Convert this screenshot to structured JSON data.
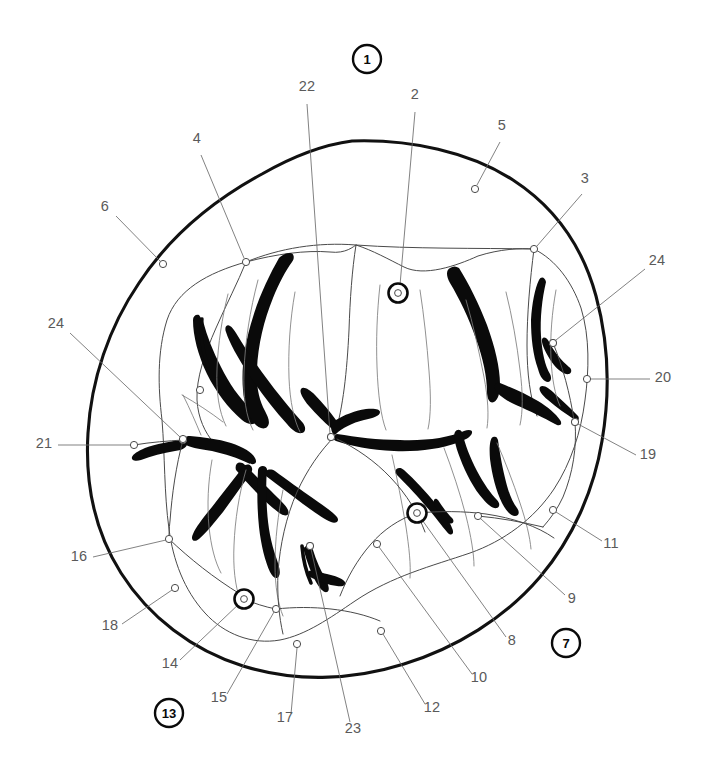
{
  "figure": {
    "kind": "anatomical-line-drawing",
    "background_color": "#ffffff",
    "outline_color": "#111111",
    "groove_color": "#0a0a0a",
    "leader_color": "#6b6b6b",
    "label_color": "#5a5a5a",
    "width": 704,
    "height": 778
  },
  "circled_references": [
    {
      "id": "circled-1",
      "label": "1",
      "cx": 367,
      "cy": 59,
      "r": 14
    },
    {
      "id": "circled-7",
      "label": "7",
      "cx": 566,
      "cy": 643,
      "r": 14
    },
    {
      "id": "circled-13",
      "label": "13",
      "cx": 169,
      "cy": 713,
      "r": 14
    }
  ],
  "callouts": [
    {
      "num": "2",
      "text_x": 415,
      "text_y": 99,
      "anchor": "middle",
      "path": "M 415 112 L 400 285",
      "marker": {
        "type": "target",
        "x": 398,
        "y": 293
      }
    },
    {
      "num": "22",
      "text_x": 307,
      "text_y": 91,
      "anchor": "middle",
      "path": "M 307 104 L 330 434",
      "marker": {
        "type": "dot",
        "x": 331,
        "y": 437
      }
    },
    {
      "num": "5",
      "text_x": 502,
      "text_y": 130,
      "anchor": "middle",
      "path": "M 500 142 L 477 185",
      "marker": {
        "type": "dot",
        "x": 475,
        "y": 189
      }
    },
    {
      "num": "4",
      "text_x": 197,
      "text_y": 143,
      "anchor": "middle",
      "path": "M 201 155 L 244 258",
      "marker": {
        "type": "dot",
        "x": 246,
        "y": 262
      }
    },
    {
      "num": "3",
      "text_x": 585,
      "text_y": 183,
      "anchor": "middle",
      "path": "M 582 194 L 537 246",
      "marker": {
        "type": "dot",
        "x": 534,
        "y": 249
      }
    },
    {
      "num": "6",
      "text_x": 105,
      "text_y": 211,
      "anchor": "middle",
      "path": "M 116 216 L 160 261",
      "marker": {
        "type": "dot",
        "x": 163,
        "y": 264
      }
    },
    {
      "num": "24",
      "text_x": 657,
      "text_y": 265,
      "anchor": "middle",
      "path": "M 645 269 L 556 340",
      "marker": {
        "type": "dot",
        "x": 553,
        "y": 343
      }
    },
    {
      "num": "24",
      "text_x": 56,
      "text_y": 328,
      "anchor": "middle",
      "path": "M 70 333 L 180 437",
      "marker": {
        "type": "dot",
        "x": 183,
        "y": 440
      }
    },
    {
      "num": "20",
      "text_x": 663,
      "text_y": 382,
      "anchor": "middle",
      "path": "M 650 379 L 590 379",
      "marker": {
        "type": "dot",
        "x": 587,
        "y": 379
      }
    },
    {
      "num": "19",
      "text_x": 648,
      "text_y": 459,
      "anchor": "middle",
      "path": "M 636 455 L 578 424",
      "marker": {
        "type": "dot",
        "x": 575,
        "y": 422
      }
    },
    {
      "num": "21",
      "text_x": 44,
      "text_y": 448,
      "anchor": "middle",
      "path": "M 58 445 L 131 445",
      "marker": {
        "type": "dot",
        "x": 134,
        "y": 445
      }
    },
    {
      "num": "11",
      "text_x": 611,
      "text_y": 548,
      "anchor": "middle",
      "path": "M 602 541 L 556 512",
      "marker": {
        "type": "dot",
        "x": 553,
        "y": 510
      }
    },
    {
      "num": "16",
      "text_x": 79,
      "text_y": 561,
      "anchor": "middle",
      "path": "M 93 557 L 166 540",
      "marker": {
        "type": "dot",
        "x": 169,
        "y": 539
      }
    },
    {
      "num": "9",
      "text_x": 572,
      "text_y": 603,
      "anchor": "middle",
      "path": "M 565 595 L 481 519",
      "marker": {
        "type": "dot",
        "x": 478,
        "y": 516
      }
    },
    {
      "num": "18",
      "text_x": 110,
      "text_y": 630,
      "anchor": "middle",
      "path": "M 122 624 L 172 590",
      "marker": {
        "type": "dot",
        "x": 175,
        "y": 588
      }
    },
    {
      "num": "8",
      "text_x": 512,
      "text_y": 645,
      "anchor": "middle",
      "path": "M 506 637 L 420 517",
      "marker": {
        "type": "target",
        "x": 417,
        "y": 513
      }
    },
    {
      "num": "14",
      "text_x": 170,
      "text_y": 668,
      "anchor": "middle",
      "path": "M 180 660 L 241 602",
      "marker": {
        "type": "target",
        "x": 244,
        "y": 599
      }
    },
    {
      "num": "10",
      "text_x": 479,
      "text_y": 682,
      "anchor": "middle",
      "path": "M 472 674 L 379 547",
      "marker": {
        "type": "dot",
        "x": 377,
        "y": 544
      }
    },
    {
      "num": "12",
      "text_x": 432,
      "text_y": 712,
      "anchor": "middle",
      "path": "M 425 704 L 383 634",
      "marker": {
        "type": "dot",
        "x": 381,
        "y": 631
      }
    },
    {
      "num": "15",
      "text_x": 219,
      "text_y": 702,
      "anchor": "middle",
      "path": "M 227 694 L 274 612",
      "marker": {
        "type": "dot",
        "x": 276,
        "y": 609
      }
    },
    {
      "num": "17",
      "text_x": 285,
      "text_y": 722,
      "anchor": "middle",
      "path": "M 291 714 L 297 648",
      "marker": {
        "type": "dot",
        "x": 297,
        "y": 644
      }
    },
    {
      "num": "23",
      "text_x": 353,
      "text_y": 733,
      "anchor": "middle",
      "path": "M 350 722 L 311 549",
      "marker": {
        "type": "dot",
        "x": 310,
        "y": 546
      }
    }
  ],
  "internal_markers": [
    {
      "id": "junction-a",
      "x": 183,
      "y": 439
    },
    {
      "id": "junction-b",
      "x": 200,
      "y": 390
    },
    {
      "id": "junction-c",
      "x": 331,
      "y": 437
    },
    {
      "id": "junction-d",
      "x": 575,
      "y": 422
    },
    {
      "id": "junction-e",
      "x": 553,
      "y": 343
    },
    {
      "id": "junction-f",
      "x": 310,
      "y": 546
    }
  ],
  "chart_data": {
    "type": "table",
    "columns": [
      "callout",
      "kind"
    ],
    "rows": [
      [
        "1",
        "circled-reference"
      ],
      [
        "2",
        "target-marker"
      ],
      [
        "3",
        "dot-marker"
      ],
      [
        "4",
        "dot-marker"
      ],
      [
        "5",
        "dot-marker"
      ],
      [
        "6",
        "dot-marker"
      ],
      [
        "7",
        "circled-reference"
      ],
      [
        "8",
        "target-marker"
      ],
      [
        "9",
        "dot-marker"
      ],
      [
        "10",
        "dot-marker"
      ],
      [
        "11",
        "dot-marker"
      ],
      [
        "12",
        "dot-marker"
      ],
      [
        "13",
        "circled-reference"
      ],
      [
        "14",
        "target-marker"
      ],
      [
        "15",
        "dot-marker"
      ],
      [
        "16",
        "dot-marker"
      ],
      [
        "17",
        "dot-marker"
      ],
      [
        "18",
        "dot-marker"
      ],
      [
        "19",
        "dot-marker"
      ],
      [
        "20",
        "dot-marker"
      ],
      [
        "21",
        "dot-marker"
      ],
      [
        "22",
        "dot-marker"
      ],
      [
        "23",
        "dot-marker"
      ],
      [
        "24",
        "dot-marker"
      ]
    ]
  }
}
